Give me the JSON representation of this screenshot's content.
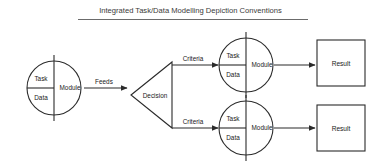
{
  "title": {
    "text": "Integrated Task/Data Modelling Depiction Conventions"
  },
  "colors": {
    "background": "#ffffff",
    "stroke": "#2b2b2b",
    "text": "#1a1a1a",
    "title_rule": "#6b6b6b"
  },
  "diagram": {
    "type": "flow-diagram",
    "source_node": {
      "shape": "circle",
      "task_label": "Task",
      "data_label": "Data",
      "module_label": "Module"
    },
    "feeds_edge": {
      "label": "Feeds"
    },
    "decision_node": {
      "shape": "triangle",
      "label": "Decision"
    },
    "branches": [
      {
        "criteria_label": "Criteria",
        "node": {
          "shape": "circle",
          "task_label": "Task",
          "data_label": "Data",
          "module_label": "Module"
        },
        "result": {
          "shape": "square",
          "label": "Result"
        }
      },
      {
        "criteria_label": "Criteria",
        "node": {
          "shape": "circle",
          "task_label": "Task",
          "data_label": "Data",
          "module_label": "Module"
        },
        "result": {
          "shape": "square",
          "label": "Result"
        }
      }
    ]
  }
}
